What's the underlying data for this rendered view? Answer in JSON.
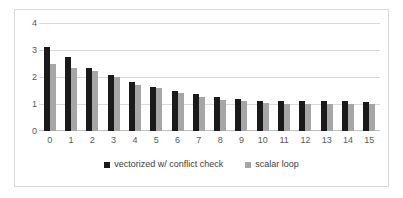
{
  "chart_data": {
    "type": "bar",
    "title": "",
    "subtitle": "",
    "xlabel": "",
    "ylabel": "",
    "categories": [
      "0",
      "1",
      "2",
      "3",
      "4",
      "5",
      "6",
      "7",
      "8",
      "9",
      "10",
      "11",
      "12",
      "13",
      "14",
      "15"
    ],
    "series": [
      {
        "name": "vectorized w/ conflict check",
        "color": "#1a1a1a",
        "values": [
          3.1,
          2.75,
          2.35,
          2.08,
          1.8,
          1.62,
          1.48,
          1.36,
          1.26,
          1.2,
          1.13,
          1.1,
          1.1,
          1.12,
          1.12,
          1.08
        ]
      },
      {
        "name": "scalar loop",
        "color": "#a6a6a6",
        "values": [
          2.5,
          2.35,
          2.22,
          2.0,
          1.72,
          1.6,
          1.4,
          1.25,
          1.16,
          1.1,
          1.04,
          1.01,
          1.0,
          1.0,
          0.99,
          1.0
        ]
      }
    ],
    "ylim": [
      0,
      4
    ],
    "yticks": [
      "0",
      "1",
      "2",
      "3",
      "4"
    ],
    "grid": true,
    "legend_position": "bottom-center"
  },
  "axes": {
    "y_ticks": [
      {
        "label": "4",
        "value": 4
      },
      {
        "label": "3",
        "value": 3
      },
      {
        "label": "2",
        "value": 2
      },
      {
        "label": "1",
        "value": 1
      },
      {
        "label": "0",
        "value": 0
      }
    ]
  },
  "legend": {
    "items": [
      {
        "label": "vectorized w/ conflict check",
        "marker": "square-marker-black"
      },
      {
        "label": "scalar loop",
        "marker": "square-marker-gray"
      }
    ]
  }
}
